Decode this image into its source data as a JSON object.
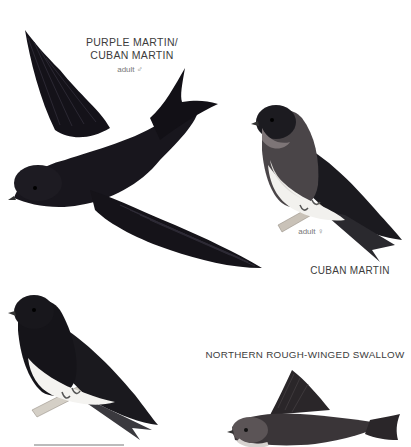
{
  "page": {
    "background": "#ffffff",
    "text_color": "#3c3c3c"
  },
  "plates": [
    {
      "id": "purple-martin-flying",
      "title_line1": "PURPLE MARTIN/",
      "title_line2": "CUBAN MARTIN",
      "sub": "adult ♂",
      "pose": "flying",
      "plumage": "dark glossy purple-black"
    },
    {
      "id": "cuban-martin-female",
      "title": "CUBAN MARTIN",
      "sub": "adult ♀",
      "pose": "perched",
      "plumage": "dark upperparts, grey-brown breast, white belly"
    },
    {
      "id": "bottom-left-martin",
      "title": "",
      "pose": "perched",
      "plumage": "dark with white belly",
      "caption_cut_off": true
    },
    {
      "id": "northern-rough-winged-swallow",
      "title": "NORTHERN ROUGH-WINGED SWALLOW",
      "pose": "flying",
      "plumage": "brown upperparts, pale underparts"
    }
  ]
}
